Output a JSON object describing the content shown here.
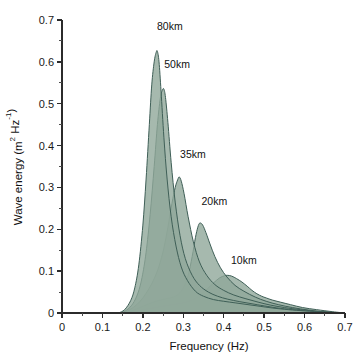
{
  "chart_data": {
    "type": "area",
    "title": "",
    "xlabel": "Frequency (Hz)",
    "ylabel": "Wave energy (m² Hz⁻¹)",
    "xlim": [
      0,
      0.7
    ],
    "ylim": [
      0,
      0.7
    ],
    "xticks": [
      "0",
      "0.1",
      "0.2",
      "0.3",
      "0.4",
      "0.5",
      "0.6",
      "0.7"
    ],
    "xtick_values": [
      0,
      0.1,
      0.2,
      0.3,
      0.4,
      0.5,
      0.6,
      0.7
    ],
    "yticks": [
      "0",
      "0.1",
      "0.2",
      "0.3",
      "0.4",
      "0.5",
      "0.6",
      "0.7"
    ],
    "ytick_values": [
      0,
      0.1,
      0.2,
      0.3,
      0.4,
      0.5,
      0.6,
      0.7
    ],
    "minor_tick_step": 0.05,
    "grid": false,
    "legend_position": "inline-annotations",
    "fill_color": "#90a89a",
    "line_color": "#3f5f57",
    "series": [
      {
        "name": "80km",
        "label": "80km",
        "label_x": 0.235,
        "label_y": 0.675,
        "peak_x": 0.235,
        "peak_y": 0.625,
        "x": [
          0.14,
          0.155,
          0.17,
          0.18,
          0.19,
          0.2,
          0.208,
          0.216,
          0.222,
          0.228,
          0.233,
          0.236,
          0.24,
          0.245,
          0.252,
          0.26,
          0.27,
          0.282,
          0.295,
          0.31,
          0.33,
          0.35,
          0.375,
          0.4,
          0.43,
          0.46,
          0.49,
          0.52,
          0.56,
          0.6,
          0.65,
          0.7
        ],
        "y": [
          0.0,
          0.008,
          0.03,
          0.06,
          0.115,
          0.21,
          0.32,
          0.45,
          0.545,
          0.6,
          0.623,
          0.625,
          0.6,
          0.53,
          0.42,
          0.32,
          0.23,
          0.16,
          0.11,
          0.078,
          0.052,
          0.04,
          0.032,
          0.028,
          0.024,
          0.02,
          0.016,
          0.012,
          0.008,
          0.005,
          0.002,
          0.0
        ]
      },
      {
        "name": "50km",
        "label": "50km",
        "label_x": 0.253,
        "label_y": 0.585,
        "peak_x": 0.252,
        "peak_y": 0.535,
        "x": [
          0.145,
          0.16,
          0.175,
          0.188,
          0.198,
          0.208,
          0.218,
          0.228,
          0.236,
          0.243,
          0.248,
          0.252,
          0.256,
          0.262,
          0.27,
          0.28,
          0.292,
          0.305,
          0.322,
          0.34,
          0.362,
          0.385,
          0.41,
          0.44,
          0.47,
          0.5,
          0.54,
          0.58,
          0.63,
          0.7
        ],
        "y": [
          0.0,
          0.007,
          0.022,
          0.048,
          0.085,
          0.145,
          0.235,
          0.35,
          0.45,
          0.512,
          0.532,
          0.535,
          0.515,
          0.455,
          0.36,
          0.265,
          0.185,
          0.13,
          0.09,
          0.066,
          0.05,
          0.04,
          0.033,
          0.027,
          0.022,
          0.017,
          0.011,
          0.007,
          0.003,
          0.0
        ]
      },
      {
        "name": "35km",
        "label": "35km",
        "label_x": 0.292,
        "label_y": 0.37,
        "peak_x": 0.29,
        "peak_y": 0.325,
        "x": [
          0.15,
          0.168,
          0.185,
          0.2,
          0.215,
          0.228,
          0.24,
          0.252,
          0.262,
          0.272,
          0.28,
          0.286,
          0.29,
          0.295,
          0.302,
          0.312,
          0.325,
          0.34,
          0.358,
          0.378,
          0.4,
          0.425,
          0.455,
          0.485,
          0.515,
          0.55,
          0.59,
          0.64,
          0.7
        ],
        "y": [
          0.0,
          0.008,
          0.02,
          0.036,
          0.058,
          0.082,
          0.112,
          0.155,
          0.205,
          0.262,
          0.3,
          0.318,
          0.325,
          0.315,
          0.285,
          0.23,
          0.17,
          0.122,
          0.09,
          0.068,
          0.054,
          0.043,
          0.034,
          0.026,
          0.019,
          0.013,
          0.008,
          0.003,
          0.0
        ]
      },
      {
        "name": "20km",
        "label": "20km",
        "label_x": 0.345,
        "label_y": 0.258,
        "peak_x": 0.34,
        "peak_y": 0.215,
        "x": [
          0.155,
          0.175,
          0.195,
          0.215,
          0.232,
          0.248,
          0.262,
          0.275,
          0.288,
          0.3,
          0.312,
          0.322,
          0.33,
          0.336,
          0.341,
          0.348,
          0.356,
          0.366,
          0.378,
          0.392,
          0.408,
          0.428,
          0.45,
          0.478,
          0.505,
          0.535,
          0.57,
          0.61,
          0.655,
          0.7
        ],
        "y": [
          0.0,
          0.006,
          0.014,
          0.022,
          0.028,
          0.032,
          0.035,
          0.038,
          0.045,
          0.06,
          0.09,
          0.135,
          0.18,
          0.205,
          0.215,
          0.21,
          0.192,
          0.165,
          0.135,
          0.108,
          0.086,
          0.066,
          0.052,
          0.038,
          0.028,
          0.02,
          0.013,
          0.007,
          0.002,
          0.0
        ]
      },
      {
        "name": "10km",
        "label": "10km",
        "label_x": 0.418,
        "label_y": 0.118,
        "peak_x": 0.41,
        "peak_y": 0.09,
        "x": [
          0.16,
          0.185,
          0.21,
          0.235,
          0.258,
          0.278,
          0.296,
          0.312,
          0.328,
          0.344,
          0.36,
          0.375,
          0.39,
          0.402,
          0.41,
          0.42,
          0.432,
          0.445,
          0.458,
          0.47,
          0.482,
          0.494,
          0.505,
          0.52,
          0.54,
          0.565,
          0.595,
          0.63,
          0.67,
          0.7
        ],
        "y": [
          0.0,
          0.005,
          0.01,
          0.014,
          0.018,
          0.021,
          0.024,
          0.028,
          0.034,
          0.044,
          0.058,
          0.072,
          0.084,
          0.089,
          0.09,
          0.088,
          0.082,
          0.074,
          0.064,
          0.054,
          0.046,
          0.04,
          0.036,
          0.031,
          0.026,
          0.02,
          0.013,
          0.008,
          0.003,
          0.0
        ]
      }
    ]
  }
}
